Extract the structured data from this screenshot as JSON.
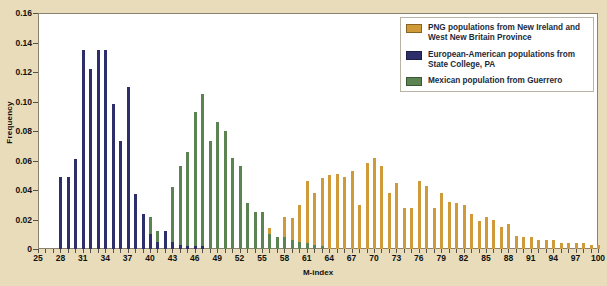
{
  "axes": {
    "ylabel": "Frequency",
    "xlabel": "M-index",
    "yticks": [
      "0",
      "0.02",
      "0.04",
      "0.06",
      "0.08",
      "0.10",
      "0.12",
      "0.14",
      "0.16"
    ],
    "xticks": [
      "25",
      "28",
      "31",
      "34",
      "37",
      "40",
      "43",
      "46",
      "49",
      "52",
      "55",
      "58",
      "61",
      "64",
      "67",
      "70",
      "73",
      "76",
      "79",
      "82",
      "85",
      "88",
      "91",
      "94",
      "97",
      "100"
    ]
  },
  "legend": {
    "position": "top-right",
    "items": [
      {
        "label": "PNG populations from New Ireland and West New Britain Province",
        "color": "#cf9a37"
      },
      {
        "label": "European-American populations from State College, PA",
        "color": "#2e2e6b"
      },
      {
        "label": "Mexican population from Guerrero",
        "color": "#5c8352"
      }
    ]
  },
  "colors": {
    "png": "#cf9a37",
    "euro_american": "#2e2e6b",
    "mexican": "#5c8352",
    "background": "#e8dcba",
    "plot_background": "#ffffff",
    "axis": "#55504a"
  },
  "chart_data": {
    "type": "bar",
    "title": "",
    "xlabel": "M-index",
    "ylabel": "Frequency",
    "xlim": [
      25,
      100
    ],
    "ylim": [
      0,
      0.16
    ],
    "grid": false,
    "legend_position": "top-right",
    "x": [
      25,
      26,
      27,
      28,
      29,
      30,
      31,
      32,
      33,
      34,
      35,
      36,
      37,
      38,
      39,
      40,
      41,
      42,
      43,
      44,
      45,
      46,
      47,
      48,
      49,
      50,
      51,
      52,
      53,
      54,
      55,
      56,
      57,
      58,
      59,
      60,
      61,
      62,
      63,
      64,
      65,
      66,
      67,
      68,
      69,
      70,
      71,
      72,
      73,
      74,
      75,
      76,
      77,
      78,
      79,
      80,
      81,
      82,
      83,
      84,
      85,
      86,
      87,
      88,
      89,
      90,
      91,
      92,
      93,
      94,
      95,
      96,
      97,
      98,
      99,
      100
    ],
    "series": [
      {
        "name": "European-American populations from State College, PA",
        "color": "#2e2e6b",
        "values": [
          0.0,
          0.0,
          0.0,
          0.049,
          0.049,
          0.061,
          0.135,
          0.122,
          0.135,
          0.135,
          0.098,
          0.073,
          0.11,
          0.037,
          0.024,
          0.01,
          0.005,
          0.012,
          0.005,
          0.003,
          0.002,
          0.002,
          0.002,
          0.0,
          0.0,
          0.0,
          0.0,
          0.0,
          0.0,
          0.0,
          0.0,
          0.0,
          0.0,
          0.0,
          0.0,
          0.0,
          0.0,
          0.0,
          0.0,
          0.0,
          0.0,
          0.0,
          0.0,
          0.0,
          0.0,
          0.0,
          0.0,
          0.0,
          0.0,
          0.0,
          0.0,
          0.0,
          0.0,
          0.0,
          0.0,
          0.0,
          0.0,
          0.0,
          0.0,
          0.0,
          0.0,
          0.0,
          0.0,
          0.0,
          0.0,
          0.0,
          0.0,
          0.0,
          0.0,
          0.0,
          0.0,
          0.0,
          0.0,
          0.0,
          0.0,
          0.0
        ]
      },
      {
        "name": "Mexican population from Guerrero",
        "color": "#5c8352",
        "values": [
          0.0,
          0.0,
          0.0,
          0.0,
          0.0,
          0.0,
          0.0,
          0.0,
          0.0,
          0.0,
          0.0,
          0.0,
          0.0,
          0.005,
          0.005,
          0.022,
          0.012,
          0.012,
          0.042,
          0.056,
          0.066,
          0.093,
          0.105,
          0.073,
          0.086,
          0.08,
          0.062,
          0.056,
          0.031,
          0.025,
          0.025,
          0.01,
          0.008,
          0.008,
          0.006,
          0.005,
          0.004,
          0.003,
          0.002,
          0.0,
          0.0,
          0.0,
          0.0,
          0.0,
          0.0,
          0.0,
          0.0,
          0.0,
          0.0,
          0.0,
          0.0,
          0.0,
          0.0,
          0.0,
          0.0,
          0.0,
          0.0,
          0.0,
          0.0,
          0.0,
          0.0,
          0.0,
          0.0,
          0.0,
          0.0,
          0.0,
          0.0,
          0.0,
          0.0,
          0.0,
          0.0,
          0.0,
          0.0,
          0.0,
          0.0,
          0.0
        ]
      },
      {
        "name": "PNG populations from New Ireland and West New Britain Province",
        "color": "#cf9a37",
        "values": [
          0.0,
          0.0,
          0.0,
          0.0,
          0.0,
          0.0,
          0.0,
          0.0,
          0.0,
          0.0,
          0.0,
          0.0,
          0.0,
          0.0,
          0.0,
          0.0,
          0.0,
          0.0,
          0.0,
          0.0,
          0.0,
          0.0,
          0.0,
          0.0,
          0.0,
          0.0,
          0.0,
          0.0,
          0.004,
          0.006,
          0.01,
          0.014,
          0.007,
          0.022,
          0.021,
          0.03,
          0.046,
          0.038,
          0.048,
          0.05,
          0.051,
          0.049,
          0.053,
          0.03,
          0.058,
          0.062,
          0.056,
          0.038,
          0.045,
          0.028,
          0.028,
          0.046,
          0.043,
          0.028,
          0.038,
          0.032,
          0.031,
          0.03,
          0.024,
          0.019,
          0.022,
          0.02,
          0.015,
          0.017,
          0.009,
          0.008,
          0.008,
          0.006,
          0.006,
          0.006,
          0.004,
          0.004,
          0.004,
          0.004,
          0.003,
          0.003
        ]
      }
    ]
  }
}
